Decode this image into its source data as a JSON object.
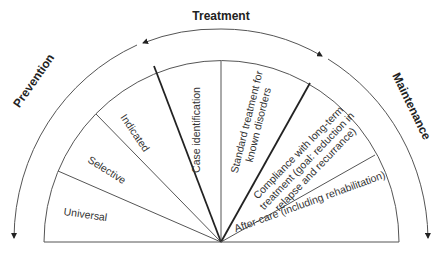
{
  "phases": {
    "prevention": "Prevention",
    "treatment": "Treatment",
    "maintenance": "Maintenance"
  },
  "segments": [
    {
      "label": "Universal",
      "phase": "Prevention"
    },
    {
      "label": "Selective",
      "phase": "Prevention"
    },
    {
      "label": "Indicated",
      "phase": "Prevention"
    },
    {
      "label": "Case identification",
      "phase": "Treatment"
    },
    {
      "label_line1": "Standard treatment for",
      "label_line2": "known disorders",
      "phase": "Treatment"
    },
    {
      "label_line1": "Compliance with long-term",
      "label_line2": "treatment (goal: reduction in",
      "label_line3": "relapse and recurrance)",
      "phase": "Maintenance"
    },
    {
      "label": "After-care (including rehabilitation)",
      "phase": "Maintenance"
    }
  ],
  "colors": {
    "line": "#555555",
    "bold_line": "#222222",
    "text": "#333333"
  }
}
